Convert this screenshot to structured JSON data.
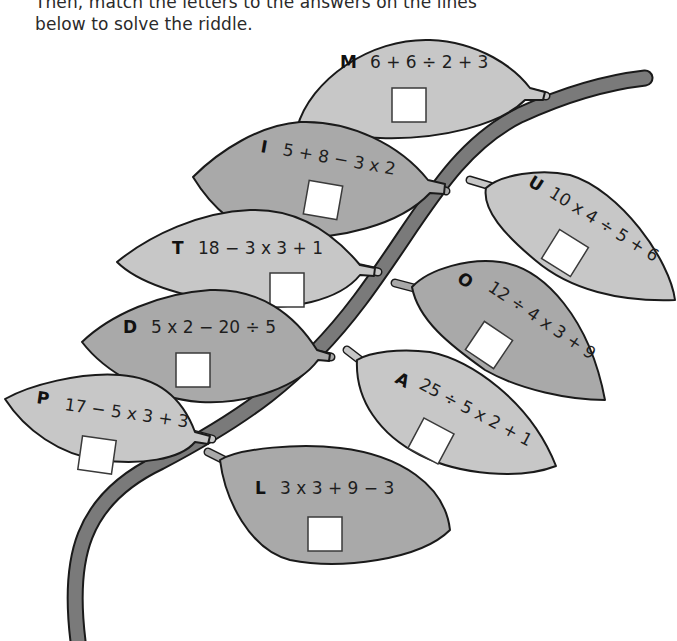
{
  "instructions": {
    "line1": "Then, match the letters to the answers on the lines",
    "line2": "below to solve the riddle."
  },
  "colors": {
    "leaf_light": "#c7c7c7",
    "leaf_dark": "#a9a9a9",
    "branch": "#7a7a7a",
    "outline": "#1a1a1a",
    "answer_box": "#ffffff"
  },
  "leaves": [
    {
      "letter": "M",
      "expression": "6 + 6 ÷ 2 + 3",
      "shade": "light",
      "answer": ""
    },
    {
      "letter": "I",
      "expression": "5 + 8 − 3 x 2",
      "shade": "dark",
      "answer": ""
    },
    {
      "letter": "U",
      "expression": "10 x 4 ÷ 5 + 6",
      "shade": "light",
      "answer": ""
    },
    {
      "letter": "T",
      "expression": "18 − 3 x 3 + 1",
      "shade": "light",
      "answer": ""
    },
    {
      "letter": "O",
      "expression": "12 ÷ 4 x 3 + 9",
      "shade": "dark",
      "answer": ""
    },
    {
      "letter": "D",
      "expression": "5 x 2 − 20 ÷ 5",
      "shade": "dark",
      "answer": ""
    },
    {
      "letter": "A",
      "expression": "25 ÷ 5 x 2 + 1",
      "shade": "light",
      "answer": ""
    },
    {
      "letter": "P",
      "expression": "17 − 5 x 3 + 3",
      "shade": "light",
      "answer": ""
    },
    {
      "letter": "L",
      "expression": "3 x 3 + 9 − 3",
      "shade": "dark",
      "answer": ""
    }
  ]
}
